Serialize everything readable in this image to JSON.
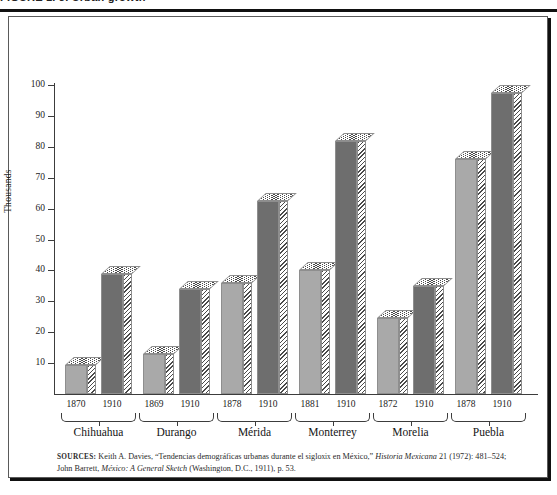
{
  "page": {
    "top_caption": "FIGURE 1. 3. Urban growth",
    "sources_line1": "SOURCES: Keith A. Davies, “Tendencias demográficas urbanas durante el siglo xix en México,” Historia",
    "sources_line2": "Mexicana 21 (1972): 481–524; John Barrett, México: A General Sketch (Washington, D.C., 1911), p. 53.",
    "sources_label": "SOURCES:",
    "source_author_1": "Keith A. Davies,",
    "source_title_1": "“Tendencias demográficas urbanas durante el siglo",
    "source_smallcaps_1": "xix",
    "source_title_1b": "en México,”",
    "source_journal_1": "Historia Mexicana",
    "source_cite_1": "21 (1972): 481–524;",
    "source_author_2": "John Barrett,",
    "source_journal_2": "México: A General Sketch",
    "source_cite_2": "(Washington, D.C., 1911), p. 53."
  },
  "colors": {
    "bar_early": "#a9a9a9",
    "bar_late": "#6e6e6e",
    "axis": "#3c3c3c",
    "frame": "#5a5a5a",
    "hatch": "#4a4a4a",
    "background": "#ffffff"
  },
  "chart_data": {
    "type": "bar",
    "title": "",
    "xlabel": "",
    "ylabel": "Thousands",
    "ylim": [
      0,
      100
    ],
    "yticks": [
      10,
      20,
      30,
      40,
      50,
      60,
      70,
      80,
      90,
      100
    ],
    "ytick_labels": [
      "10",
      "20",
      "30",
      "40",
      "50",
      "60",
      "70",
      "80",
      "90",
      "100"
    ],
    "grid": false,
    "legend": "none",
    "categories": [
      "Chihuahua",
      "Durango",
      "Mérida",
      "Monterrey",
      "Morelia",
      "Puebla"
    ],
    "groups": [
      {
        "city": "Chihuahua",
        "bars": [
          {
            "year": "1870",
            "value": 9.5,
            "shade": "light"
          },
          {
            "year": "1910",
            "value": 39.0,
            "shade": "dark"
          }
        ]
      },
      {
        "city": "Durango",
        "bars": [
          {
            "year": "1869",
            "value": 13.0,
            "shade": "light"
          },
          {
            "year": "1910",
            "value": 34.0,
            "shade": "dark"
          }
        ]
      },
      {
        "city": "Mérida",
        "bars": [
          {
            "year": "1878",
            "value": 36.0,
            "shade": "light"
          },
          {
            "year": "1910",
            "value": 62.5,
            "shade": "dark"
          }
        ]
      },
      {
        "city": "Monterrey",
        "bars": [
          {
            "year": "1881",
            "value": 40.0,
            "shade": "light"
          },
          {
            "year": "1910",
            "value": 82.0,
            "shade": "dark"
          }
        ]
      },
      {
        "city": "Morelia",
        "bars": [
          {
            "year": "1872",
            "value": 24.5,
            "shade": "light"
          },
          {
            "year": "1910",
            "value": 35.0,
            "shade": "dark"
          }
        ]
      },
      {
        "city": "Puebla",
        "bars": [
          {
            "year": "1878",
            "value": 76.0,
            "shade": "light"
          },
          {
            "year": "1910",
            "value": 97.5,
            "shade": "dark"
          }
        ]
      }
    ]
  }
}
